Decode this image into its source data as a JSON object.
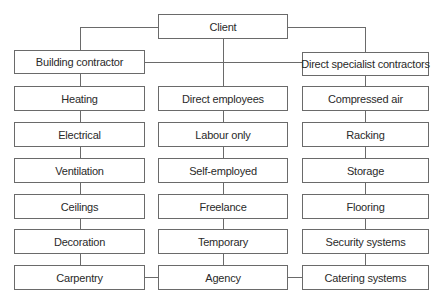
{
  "diagram": {
    "type": "organization-chart",
    "root": {
      "label": "Client"
    },
    "branches": {
      "left": {
        "label": "Building contractor",
        "children": [
          "Heating",
          "Electrical",
          "Ventilation",
          "Ceilings",
          "Decoration",
          "Carpentry"
        ]
      },
      "middle": {
        "children": [
          "Direct employees",
          "Labour only",
          "Self-employed",
          "Freelance",
          "Temporary",
          "Agency"
        ]
      },
      "right": {
        "label": "Direct specialist contractors",
        "children": [
          "Compressed air",
          "Racking",
          "Storage",
          "Flooring",
          "Security systems",
          "Catering systems"
        ]
      }
    },
    "edges": [
      [
        "Client",
        "Building contractor"
      ],
      [
        "Client",
        "Direct specialist contractors"
      ],
      [
        "Client",
        "Direct employees"
      ],
      [
        "Building contractor",
        "Direct specialist contractors"
      ],
      [
        "Carpentry",
        "Agency"
      ],
      [
        "Agency",
        "Catering systems"
      ]
    ],
    "colors": {
      "line": "#6a6a6a",
      "text": "#2a2a2a",
      "background": "#ffffff"
    }
  }
}
